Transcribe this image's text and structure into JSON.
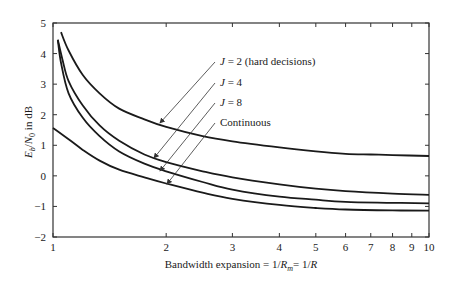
{
  "chart_data": {
    "type": "line",
    "title": "",
    "xlabel": "Bandwidth expansion = 1/R_m = 1/R",
    "xlabel_parts": {
      "pre": "Bandwidth expansion = 1/",
      "R": "R",
      "sub": "m",
      "post": "= 1/",
      "R2": "R"
    },
    "ylabel": "E_b/N_0 in dB",
    "ylabel_parts": {
      "E": "E",
      "b": "b",
      "slash": "/",
      "N": "N",
      "zero": "0",
      "post": " in dB"
    },
    "xscale": "log",
    "xlim": [
      1,
      10
    ],
    "ylim": [
      -2,
      5
    ],
    "grid": false,
    "legend": "annotations with arrows",
    "xticks": [
      1,
      2,
      3,
      4,
      5,
      6,
      7,
      8,
      9,
      10
    ],
    "xtick_labels": [
      "1",
      "2",
      "3",
      "4",
      "5",
      "6",
      "7",
      "8",
      "9",
      "10"
    ],
    "yticks": [
      -2,
      -1,
      0,
      1,
      2,
      3,
      4,
      5
    ],
    "ytick_labels": [
      "−2",
      "−1",
      "0",
      "1",
      "2",
      "3",
      "4",
      "5"
    ],
    "series": [
      {
        "name": "J = 2 (hard decisions)",
        "x": [
          1.05,
          1.1,
          1.2,
          1.33,
          1.5,
          1.75,
          2,
          2.5,
          3,
          4,
          5,
          6,
          7,
          8,
          10
        ],
        "y": [
          4.7,
          4.1,
          3.3,
          2.7,
          2.2,
          1.85,
          1.6,
          1.3,
          1.13,
          0.93,
          0.8,
          0.72,
          0.7,
          0.68,
          0.65
        ],
        "label": {
          "text_prefix": "J",
          "text_rest": " = 2 (hard decisions)",
          "lx": 220,
          "ly": 65,
          "arrow_from": [
            215,
            62
          ],
          "arrow_to": [
            160,
            123
          ]
        }
      },
      {
        "name": "J = 4",
        "x": [
          1.03,
          1.06,
          1.1,
          1.2,
          1.33,
          1.5,
          1.75,
          2,
          2.5,
          3,
          4,
          5,
          6,
          8,
          10
        ],
        "y": [
          4.45,
          3.8,
          3.1,
          2.3,
          1.65,
          1.15,
          0.7,
          0.45,
          0.15,
          -0.05,
          -0.28,
          -0.42,
          -0.5,
          -0.58,
          -0.62
        ],
        "label": {
          "text_prefix": "J",
          "text_rest": " = 4",
          "lx": 220,
          "ly": 86,
          "arrow_from": [
            215,
            83
          ],
          "arrow_to": [
            154,
            158
          ]
        }
      },
      {
        "name": "J = 8",
        "x": [
          1.03,
          1.05,
          1.1,
          1.2,
          1.33,
          1.5,
          1.75,
          2,
          2.5,
          3,
          4,
          5,
          6,
          8,
          10
        ],
        "y": [
          4.45,
          3.7,
          2.7,
          1.9,
          1.3,
          0.8,
          0.4,
          0.15,
          -0.2,
          -0.45,
          -0.68,
          -0.78,
          -0.85,
          -0.88,
          -0.9
        ],
        "label": {
          "text_prefix": "J",
          "text_rest": " = 8",
          "lx": 220,
          "ly": 106,
          "arrow_from": [
            215,
            103
          ],
          "arrow_to": [
            160,
            171
          ]
        }
      },
      {
        "name": "Continuous",
        "x": [
          1,
          1.1,
          1.2,
          1.33,
          1.5,
          1.75,
          2,
          2.5,
          3,
          4,
          5,
          6,
          8,
          10
        ],
        "y": [
          1.57,
          1.2,
          0.85,
          0.5,
          0.2,
          -0.05,
          -0.25,
          -0.55,
          -0.75,
          -0.95,
          -1.05,
          -1.1,
          -1.13,
          -1.14
        ],
        "label": {
          "text_prefix": "",
          "text_rest": "Continuous",
          "lx": 220,
          "ly": 126,
          "arrow_from": [
            215,
            123
          ],
          "arrow_to": [
            167,
            184
          ]
        }
      }
    ],
    "plot_area_px": {
      "left": 53,
      "right": 429,
      "top": 23,
      "bottom": 237
    },
    "colors": {
      "line": "#1a1a1a",
      "axis": "#333333",
      "arrow": "#333333"
    }
  }
}
